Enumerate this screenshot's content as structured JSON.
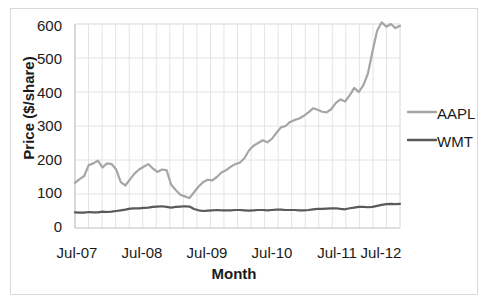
{
  "chart_data": {
    "type": "line",
    "title": "",
    "xlabel": "Month",
    "ylabel": "Price ($/share)",
    "ylim": [
      0,
      600
    ],
    "yticks": [
      0,
      100,
      200,
      300,
      400,
      500,
      600
    ],
    "xtick_labels": [
      "Jul-07",
      "Jul-08",
      "Jul-09",
      "Jul-10",
      "Jul-11",
      "Jul-12"
    ],
    "xlim_labels": [
      "Jul-07",
      "Jul-12"
    ],
    "grid": true,
    "legend_position": "right",
    "series": [
      {
        "name": "AAPL",
        "color": "#a6a6a6",
        "values": [
          133,
          144,
          153,
          185,
          190,
          198,
          178,
          190,
          188,
          172,
          135,
          125,
          143,
          160,
          172,
          180,
          188,
          175,
          165,
          172,
          170,
          128,
          112,
          98,
          93,
          88,
          105,
          122,
          135,
          142,
          140,
          150,
          163,
          170,
          180,
          188,
          192,
          205,
          228,
          242,
          250,
          258,
          252,
          262,
          280,
          296,
          300,
          312,
          318,
          322,
          330,
          340,
          352,
          348,
          342,
          340,
          350,
          368,
          378,
          372,
          390,
          412,
          400,
          420,
          455,
          520,
          580,
          605,
          592,
          600,
          588,
          595
        ]
      },
      {
        "name": "WMT",
        "color": "#595959",
        "values": [
          46,
          45,
          45,
          47,
          46,
          46,
          48,
          47,
          48,
          50,
          52,
          54,
          57,
          58,
          58,
          59,
          60,
          62,
          63,
          64,
          62,
          60,
          62,
          63,
          64,
          63,
          56,
          52,
          50,
          51,
          52,
          53,
          52,
          52,
          52,
          53,
          53,
          52,
          51,
          52,
          53,
          53,
          52,
          53,
          54,
          54,
          53,
          53,
          53,
          52,
          52,
          53,
          55,
          56,
          56,
          57,
          58,
          58,
          56,
          55,
          58,
          60,
          62,
          62,
          61,
          62,
          65,
          68,
          70,
          71,
          70,
          71
        ]
      }
    ]
  },
  "legend": {
    "entries": [
      {
        "label": "AAPL",
        "color": "#a6a6a6"
      },
      {
        "label": "WMT",
        "color": "#595959"
      }
    ]
  },
  "axes": {
    "y_title": "Price ($/share)",
    "x_title": "Month",
    "y_labels": [
      "600",
      "500",
      "400",
      "300",
      "200",
      "100",
      "0"
    ],
    "x_labels": [
      "Jul-07",
      "Jul-08",
      "Jul-09",
      "Jul-10",
      "Jul-11",
      "Jul-12"
    ]
  },
  "colors": {
    "aapl": "#a6a6a6",
    "wmt": "#595959",
    "grid": "#e4e4e4",
    "axis": "#bfbfbf",
    "frame": "#d9d9d9",
    "text": "#1a1a1a"
  }
}
